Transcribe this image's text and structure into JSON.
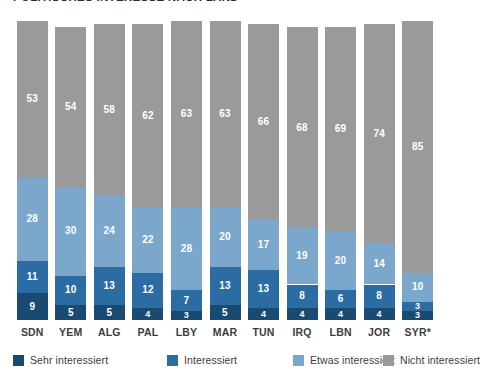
{
  "chart_data": {
    "type": "bar",
    "subtype": "stacked-bar-100",
    "title": "POLITISCHES INTERESSE NACH LAND",
    "xlabel": "",
    "ylabel": "",
    "ylim": [
      0,
      100
    ],
    "grid": false,
    "legend_position": "bottom",
    "orientation": "vertical",
    "stack_order_bottom_to_top": [
      "Sehr interessiert",
      "Interessiert",
      "Etwas interessiert",
      "Nicht interessiert"
    ],
    "categories": [
      "SDN",
      "YEM",
      "ALG",
      "PAL",
      "LBY",
      "MAR",
      "TUN",
      "IRQ",
      "LBN",
      "JOR",
      "SYR*"
    ],
    "series": [
      {
        "name": "Sehr interessiert",
        "color": "#1a4a72",
        "values": [
          9,
          5,
          5,
          4,
          3,
          5,
          4,
          4,
          4,
          4,
          3
        ]
      },
      {
        "name": "Interessiert",
        "color": "#2b6da3",
        "values": [
          11,
          10,
          13,
          12,
          7,
          13,
          13,
          8,
          6,
          8,
          3
        ]
      },
      {
        "name": "Etwas interessiert",
        "color": "#7ba7cc",
        "values": [
          28,
          30,
          24,
          22,
          28,
          20,
          17,
          19,
          20,
          14,
          10
        ]
      },
      {
        "name": "Nicht interessiert",
        "color": "#9a9a9a",
        "values": [
          53,
          54,
          58,
          62,
          63,
          63,
          66,
          68,
          69,
          74,
          85
        ]
      }
    ]
  },
  "legend": {
    "items": [
      {
        "label": "Sehr interessiert",
        "color": "#1a4a72"
      },
      {
        "label": "Interessiert",
        "color": "#2b6da3"
      },
      {
        "label": "Etwas interessiert",
        "color": "#7ba7cc"
      },
      {
        "label": "Nicht interessiert",
        "color": "#9a9a9a"
      }
    ]
  }
}
